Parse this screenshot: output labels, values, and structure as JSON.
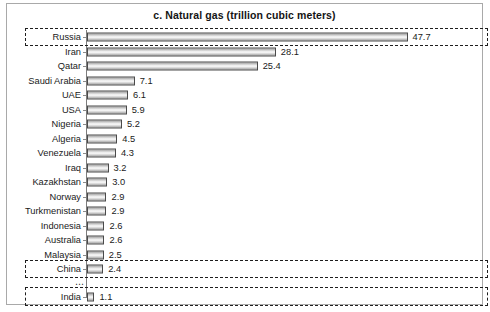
{
  "chart_data": {
    "type": "bar",
    "orientation": "horizontal",
    "title": "c. Natural gas (trillion cubic meters)",
    "xlabel": "",
    "ylabel": "",
    "unit": "trillion cubic meters",
    "xlim": [
      0,
      50
    ],
    "grid": false,
    "legend": null,
    "value_labels": true,
    "categories": [
      "Russia",
      "Iran",
      "Qatar",
      "Saudi Arabia",
      "UAE",
      "USA",
      "Nigeria",
      "Algeria",
      "Venezuela",
      "Iraq",
      "Kazakhstan",
      "Norway",
      "Turkmenistan",
      "Indonesia",
      "Australia",
      "Malaysia",
      "China",
      "India"
    ],
    "values": [
      47.7,
      28.1,
      25.4,
      7.1,
      6.1,
      5.9,
      5.2,
      4.5,
      4.3,
      3.2,
      3.0,
      2.9,
      2.9,
      2.6,
      2.6,
      2.5,
      2.4,
      1.1
    ],
    "value_label_text": [
      "47.7",
      "28.1",
      "25.4",
      "7.1",
      "6.1",
      "5.9",
      "5.2",
      "4.5",
      "4.3",
      "3.2",
      "3.0",
      "2.9",
      "2.9",
      "2.6",
      "2.6",
      "2.5",
      "2.4",
      "1.1"
    ],
    "highlighted_categories": [
      "Russia",
      "China",
      "India"
    ],
    "break_marker": "⋯",
    "break_after_category": "China",
    "colors": {
      "bar_edge": "#4a4a4a",
      "bar_fill_light": "#fbfbfb",
      "bar_fill_dark": "#9a9a9a",
      "axis": "#7d7d7d",
      "frame": "#a9a9a9",
      "text": "#1a1a1a",
      "highlight_outline": "#1e1e1e",
      "background": "#ffffff"
    }
  }
}
